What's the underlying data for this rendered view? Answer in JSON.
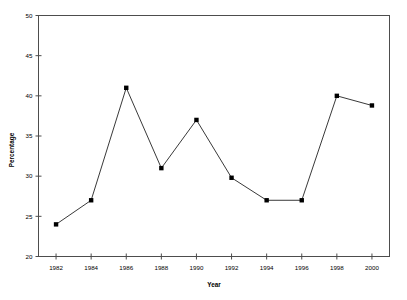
{
  "chart_data": {
    "type": "line",
    "title": "",
    "xlabel": "Year",
    "ylabel": "Percentage",
    "x": [
      1982,
      1984,
      1986,
      1988,
      1990,
      1992,
      1994,
      1996,
      1998,
      2000
    ],
    "values": [
      24,
      27,
      41,
      31,
      37,
      29.8,
      27,
      27,
      40,
      38.8
    ],
    "xlim": [
      1981,
      2001
    ],
    "ylim": [
      20,
      50
    ],
    "xticks": [
      1982,
      1984,
      1986,
      1988,
      1990,
      1992,
      1994,
      1996,
      1998,
      2000
    ],
    "xtick_labels": [
      "1982",
      "1984",
      "1986",
      "1988",
      "1990",
      "1992",
      "1994",
      "1996",
      "1998",
      "2000"
    ],
    "yticks": [
      20,
      25,
      30,
      35,
      40,
      45,
      50
    ],
    "ytick_labels": [
      "20",
      "25",
      "30",
      "35",
      "40",
      "45",
      "50"
    ],
    "grid": false,
    "legend": null,
    "marker": "filled-square",
    "line_color": "#222222",
    "marker_color": "#000000",
    "axis_color": "#4d4d4d",
    "background": "#ffffff",
    "series": [
      {
        "name": "Percentage",
        "points": [
          {
            "x": 1982,
            "y": 24
          },
          {
            "x": 1984,
            "y": 27
          },
          {
            "x": 1986,
            "y": 41
          },
          {
            "x": 1988,
            "y": 31
          },
          {
            "x": 1990,
            "y": 37
          },
          {
            "x": 1992,
            "y": 29.8
          },
          {
            "x": 1994,
            "y": 27
          },
          {
            "x": 1996,
            "y": 27
          },
          {
            "x": 1998,
            "y": 40
          },
          {
            "x": 2000,
            "y": 38.8
          }
        ]
      }
    ]
  }
}
